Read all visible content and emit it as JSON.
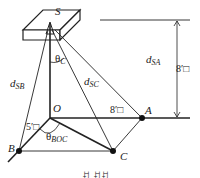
{
  "diagram": {
    "title": "",
    "source_label": "S",
    "points": {
      "O": "O",
      "A": "A",
      "B": "B",
      "C": "C"
    },
    "distances": {
      "d_SA_main": "d",
      "d_SA_sub": "SA",
      "d_SB_main": "d",
      "d_SB_sub": "SB",
      "d_SC_main": "d",
      "d_SC_sub": "SC"
    },
    "angles": {
      "theta_C_main": "θ",
      "theta_C_sub": "C",
      "theta_BOC_main": "θ",
      "theta_BOC_sub": "BOC"
    },
    "dimensions": {
      "height": "8′□",
      "OA": "8′□",
      "OB": "5′□"
    },
    "caption": "ꀀ ꀀꀀ"
  }
}
